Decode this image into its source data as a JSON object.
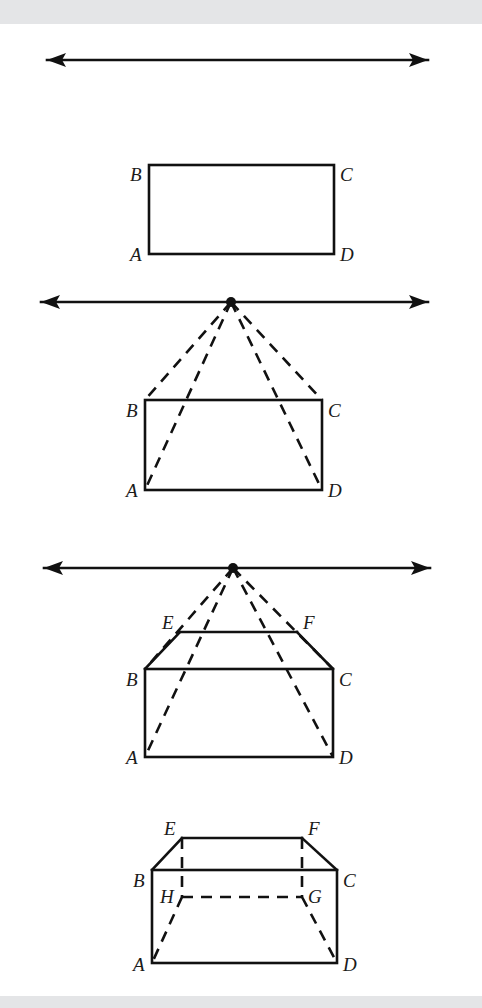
{
  "page": {
    "width": 482,
    "height": 1008,
    "background_color": "#ffffff",
    "band_color": "#e4e5e7",
    "ink_color": "#111111"
  },
  "panels": [
    {
      "id": "panel-1",
      "caption": "Horizon line and front face rectangle",
      "horizon": {
        "y": 60,
        "x1": 47,
        "x2": 428,
        "arrows": "both"
      },
      "vanishing_point": null,
      "front_face": {
        "left": 149,
        "right": 334,
        "top": 165,
        "bottom": 254,
        "labels": [
          {
            "name": "B",
            "text": "B",
            "x": 130,
            "y": 181
          },
          {
            "name": "C",
            "text": "C",
            "x": 340,
            "y": 181
          },
          {
            "name": "A",
            "text": "A",
            "x": 130,
            "y": 261
          },
          {
            "name": "D",
            "text": "D",
            "x": 340,
            "y": 261
          }
        ]
      },
      "vertex_labels": [
        "B",
        "C",
        "A",
        "D"
      ],
      "rays": []
    },
    {
      "id": "panel-2",
      "caption": "Vanishing point with four receding dashed rays",
      "horizon": {
        "y": 302,
        "x1": 41,
        "x2": 428,
        "arrows": "both"
      },
      "vanishing_point": {
        "x": 231,
        "y": 302
      },
      "front_face": {
        "left": 145,
        "right": 322,
        "top": 400,
        "bottom": 490,
        "labels": [
          {
            "name": "B",
            "text": "B",
            "x": 126,
            "y": 417
          },
          {
            "name": "C",
            "text": "C",
            "x": 328,
            "y": 417
          },
          {
            "name": "A",
            "text": "A",
            "x": 126,
            "y": 497
          },
          {
            "name": "D",
            "text": "D",
            "x": 328,
            "y": 497
          }
        ]
      },
      "vertex_labels": [
        "B",
        "C",
        "A",
        "D"
      ],
      "rays": [
        {
          "to": "B",
          "x": 145,
          "y": 400
        },
        {
          "to": "C",
          "x": 322,
          "y": 400
        },
        {
          "to": "A",
          "x": 145,
          "y": 490
        },
        {
          "to": "D",
          "x": 322,
          "y": 490
        }
      ]
    },
    {
      "id": "panel-3",
      "caption": "Back top edge EF drawn across the rays",
      "horizon": {
        "y": 568,
        "x1": 44,
        "x2": 430,
        "arrows": "both"
      },
      "vanishing_point": {
        "x": 233,
        "y": 568
      },
      "front_face": {
        "left": 145,
        "right": 333,
        "top": 669,
        "bottom": 757,
        "labels": [
          {
            "name": "B",
            "text": "B",
            "x": 126,
            "y": 686
          },
          {
            "name": "C",
            "text": "C",
            "x": 339,
            "y": 686
          },
          {
            "name": "A",
            "text": "A",
            "x": 126,
            "y": 764
          },
          {
            "name": "D",
            "text": "D",
            "x": 339,
            "y": 764
          }
        ]
      },
      "top_face": {
        "e": {
          "x": 180,
          "y": 632
        },
        "f": {
          "x": 297,
          "y": 632
        },
        "labels": [
          {
            "name": "E",
            "text": "E",
            "x": 162,
            "y": 629
          },
          {
            "name": "F",
            "text": "F",
            "x": 303,
            "y": 629
          }
        ]
      },
      "vertex_labels": [
        "B",
        "C",
        "A",
        "D",
        "E",
        "F"
      ],
      "rays": [
        {
          "to": "B",
          "x": 145,
          "y": 669
        },
        {
          "to": "C",
          "x": 333,
          "y": 669
        },
        {
          "to": "A",
          "x": 145,
          "y": 757
        },
        {
          "to": "D",
          "x": 333,
          "y": 757
        }
      ]
    },
    {
      "id": "panel-4",
      "caption": "Completed box with hidden edges H and G dashed",
      "horizon": null,
      "vanishing_point": null,
      "front_face": {
        "left": 152,
        "right": 337,
        "top": 870,
        "bottom": 963,
        "labels": [
          {
            "name": "B",
            "text": "B",
            "x": 133,
            "y": 887
          },
          {
            "name": "C",
            "text": "C",
            "x": 343,
            "y": 887
          },
          {
            "name": "A",
            "text": "A",
            "x": 133,
            "y": 971
          },
          {
            "name": "D",
            "text": "D",
            "x": 343,
            "y": 971
          }
        ]
      },
      "top_face": {
        "e": {
          "x": 182,
          "y": 838
        },
        "f": {
          "x": 302,
          "y": 838
        },
        "labels": [
          {
            "name": "E",
            "text": "E",
            "x": 164,
            "y": 835
          },
          {
            "name": "F",
            "text": "F",
            "x": 308,
            "y": 835
          }
        ]
      },
      "hidden_face": {
        "h": {
          "x": 182,
          "y": 897
        },
        "g": {
          "x": 302,
          "y": 897
        },
        "labels": [
          {
            "name": "H",
            "text": "H",
            "x": 162,
            "y": 903
          },
          {
            "name": "G",
            "text": "G",
            "x": 308,
            "y": 903
          }
        ]
      },
      "vertex_labels": [
        "B",
        "C",
        "A",
        "D",
        "E",
        "F",
        "H",
        "G"
      ],
      "rays": []
    }
  ],
  "all_vertex_labels": [
    "A",
    "B",
    "C",
    "D",
    "E",
    "F",
    "G",
    "H"
  ]
}
